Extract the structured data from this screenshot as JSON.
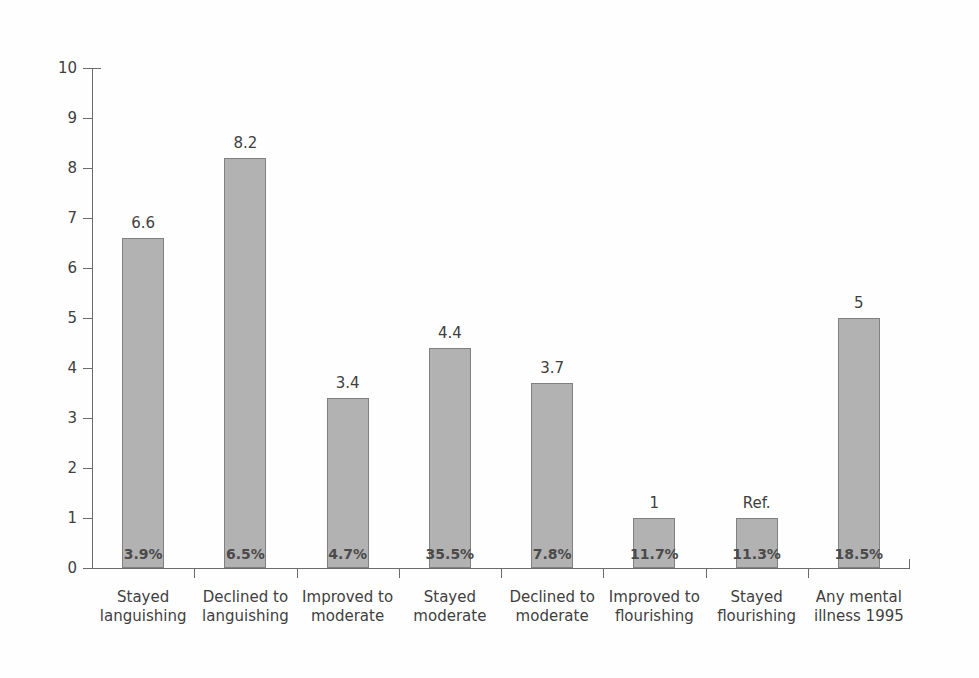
{
  "chart_data": {
    "type": "bar",
    "title": "",
    "subtitle": "",
    "xlabel": "",
    "ylabel": "",
    "ylim": [
      0,
      10
    ],
    "y_ticks": [
      0,
      1,
      2,
      3,
      4,
      5,
      6,
      7,
      8,
      9,
      10
    ],
    "y_tick_labels": [
      "0",
      "1",
      "2",
      "3",
      "4",
      "5",
      "6",
      "7",
      "8",
      "9",
      "10"
    ],
    "grid": false,
    "legend": null,
    "legend_position": "none",
    "bar_color": "#b2b2b2",
    "bar_edge_color": "#808080",
    "axis_color": "#6b6b6b",
    "background_color": "#ffffff",
    "categories": [
      "Stayed languishing",
      "Declined to languishing",
      "Improved to moderate",
      "Stayed moderate",
      "Declined to moderate",
      "Improved to flourishing",
      "Stayed flourishing",
      "Any mental illness 1995"
    ],
    "category_label_lines": [
      [
        "Stayed",
        "languishing"
      ],
      [
        "Declined to",
        "languishing"
      ],
      [
        "Improved to",
        "moderate"
      ],
      [
        "Stayed",
        "moderate"
      ],
      [
        "Declined to",
        "moderate"
      ],
      [
        "Improved to",
        "flourishing"
      ],
      [
        "Stayed",
        "flourishing"
      ],
      [
        "Any mental",
        "illness 1995"
      ]
    ],
    "values": [
      6.6,
      8.2,
      3.4,
      4.4,
      3.7,
      1.0,
      1.0,
      5.0
    ],
    "value_labels": [
      "6.6",
      "8.2",
      "3.4",
      "4.4",
      "3.7",
      "1",
      "Ref.",
      "5"
    ],
    "percent_labels": [
      "3.9%",
      "6.5%",
      "4.7%",
      "35.5%",
      "7.8%",
      "11.7%",
      "11.3%",
      "18.5%"
    ],
    "annotations": [
      "The 7th bar is the reference category, labelled 'Ref.' instead of a numeric value."
    ]
  }
}
